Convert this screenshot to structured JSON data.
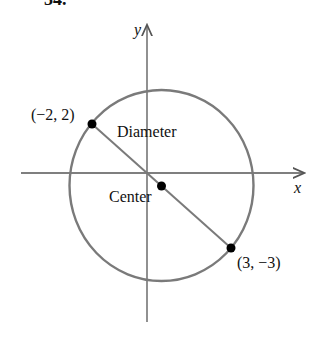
{
  "problem_number": "34.",
  "axes": {
    "x_label": "x",
    "y_label": "y"
  },
  "labels": {
    "diameter": "Diameter",
    "center": "Center",
    "point_a": "(−2, 2)",
    "point_b": "(3, −3)"
  },
  "colors": {
    "circle": "#7a7a7a",
    "axis": "#555555",
    "point": "#000000"
  }
}
